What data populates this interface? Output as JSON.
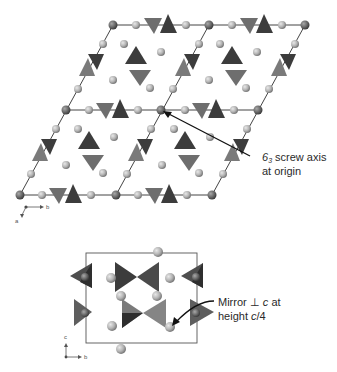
{
  "figure": {
    "top_panel": {
      "title": "Hexagonal unit cells viewed down c",
      "annotation": {
        "line1_symbol": "6",
        "line1_subscript": "3",
        "line1_rest": " screw axis",
        "line2": "at origin"
      },
      "axes": {
        "b_label": "b",
        "a_label": "a"
      }
    },
    "bottom_panel": {
      "title": "Unit cell side view",
      "annotation": {
        "line1_prefix": "Mirror ",
        "line1_perp": "⊥",
        "line1_c": " c",
        "line1_suffix": " at",
        "line2_prefix": "height ",
        "line2_c": "c",
        "line2_suffix": "/4"
      },
      "axes": {
        "c_label": "c",
        "b_label": "b"
      }
    },
    "colors": {
      "dark_tetra": "#3c3c3c",
      "mid_tetra": "#6e6e6e",
      "light_tetra": "#8a8a8a",
      "atom_light": "#b9b9b9",
      "atom_dark": "#6a6a6a",
      "lattice_line": "#444444",
      "text": "#2a2a2a"
    }
  }
}
